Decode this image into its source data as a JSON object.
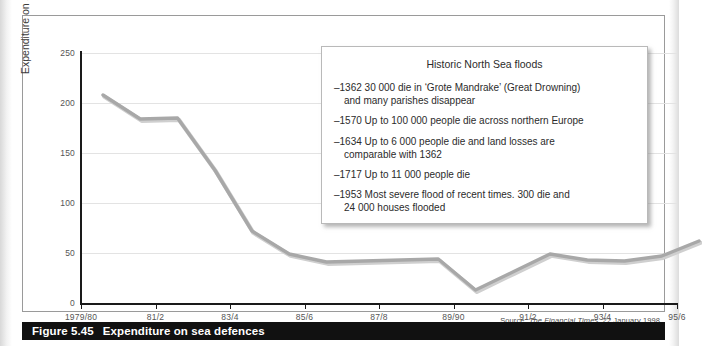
{
  "figure": {
    "caption_number": "Figure 5.45",
    "caption_title": "Expenditure on sea defences",
    "source": "Source: ",
    "source_publication": "The Financial Times",
    "source_rest": ", 22 January 1998"
  },
  "callout": {
    "title": "Historic North Sea floods",
    "items": [
      "–1362 30 000 die in ‘Grote Mandrake’ (Great Drowning)\nand many parishes disappear",
      "–1570 Up to 100 000 people die across northern Europe",
      "–1634 Up to 6 000 people die and land losses are\ncomparable with 1362",
      "–1717 Up to 11 000 people die",
      "–1953 Most severe flood of recent times. 300 die and\n24 000 houses flooded"
    ]
  },
  "colors": {
    "series_line": "#a8a8a8",
    "series_line_shadow": "#cfcfcf",
    "axis": "#1a1a1a",
    "gridline": "#e3e3e3",
    "caption_bar": "#111111",
    "caption_text": "#ffffff",
    "panel_border": "#9a9a9a",
    "callout_border": "#b9b9b9"
  },
  "chart_data": {
    "type": "line",
    "title": "Expenditure on sea defences",
    "xlabel": "",
    "ylabel": "Expenditure on sea defences (£m)",
    "ylim": [
      0,
      250
    ],
    "yticks": [
      0,
      50,
      100,
      150,
      200,
      250
    ],
    "ytick_labels": [
      "0",
      "50",
      "100",
      "150",
      "200",
      "250"
    ],
    "grid": true,
    "legend": "none",
    "xtick_labels": [
      "1979/80",
      "81/2",
      "83/4",
      "85/6",
      "87/8",
      "89/90",
      "91/2",
      "93/4",
      "95/6"
    ],
    "x": [
      "1979/80",
      "80/1",
      "81/2",
      "82/3",
      "83/4",
      "84/5",
      "85/6",
      "86/7",
      "87/8",
      "88/9",
      "89/90",
      "90/1",
      "91/2",
      "92/3",
      "93/4",
      "94/5",
      "95/6"
    ],
    "series": [
      {
        "name": "Expenditure on sea defences (£m)",
        "values": [
          223,
          199,
          200,
          148,
          87,
          64,
          56,
          57,
          58,
          59,
          28,
          46,
          64,
          58,
          57,
          62,
          77
        ]
      }
    ],
    "annotations": [
      {
        "kind": "text-box",
        "title": "Historic North Sea floods",
        "lines": [
          "–1362 30 000 die in ‘Grote Mandrake’ (Great Drowning) and many parishes disappear",
          "–1570 Up to 100 000 people die across northern Europe",
          "–1634 Up to 6 000 people die and land losses are comparable with 1362",
          "–1717 Up to 11 000 people die",
          "–1953 Most severe flood of recent times. 300 die and 24 000 houses flooded"
        ]
      },
      {
        "kind": "source",
        "text": "Source: The Financial Times, 22 January 1998"
      }
    ]
  }
}
